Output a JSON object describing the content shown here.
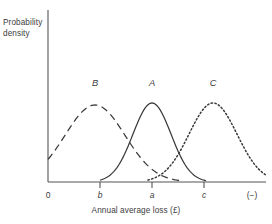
{
  "axes": {
    "ylabel": "Probability\ndensity",
    "xlabel": "Annual average loss (£)",
    "tick_labels": [
      {
        "text": "0",
        "x": 48,
        "italic": false
      },
      {
        "text": "b",
        "x": 100,
        "italic": true
      },
      {
        "text": "a",
        "x": 152,
        "italic": true
      },
      {
        "text": "c",
        "x": 204,
        "italic": true
      },
      {
        "text": "(−)",
        "x": 252,
        "italic": false
      }
    ],
    "axis_color": "#555555"
  },
  "curve_labels": [
    {
      "text": "B",
      "x": 95,
      "y": 78
    },
    {
      "text": "A",
      "x": 152,
      "y": 78
    },
    {
      "text": "C",
      "x": 213,
      "y": 78
    }
  ],
  "chart_data": {
    "type": "line",
    "title": "",
    "xlabel": "Annual average loss (£)",
    "ylabel": "Probability density",
    "xlim": [
      0,
      272
    ],
    "ylim": [
      0,
      1
    ],
    "grid": false,
    "legend": "inline-labels",
    "xtick_labels": [
      "0",
      "b",
      "a",
      "c",
      "(−)"
    ],
    "xtick_positions": [
      48,
      100,
      152,
      204,
      252
    ],
    "ytick_labels": [],
    "series": [
      {
        "name": "B",
        "style": "dashed",
        "color": "#3a3a3a",
        "mean": 95,
        "sigma": 30,
        "peak_y": 105,
        "baseline_y": 182,
        "x_start": 48,
        "x_end": 180,
        "label": "B"
      },
      {
        "name": "A",
        "style": "solid",
        "color": "#3a3a3a",
        "mean": 152,
        "sigma": 19,
        "peak_y": 103,
        "baseline_y": 182,
        "x_start": 100,
        "x_end": 206,
        "label": "A"
      },
      {
        "name": "C",
        "style": "dotted",
        "color": "#3a3a3a",
        "mean": 213,
        "sigma": 24,
        "peak_y": 103,
        "baseline_y": 182,
        "x_start": 148,
        "x_end": 266,
        "label": "C"
      }
    ]
  },
  "geometry": {
    "y_axis_x": 48,
    "y_axis_top": 10,
    "baseline_y": 182,
    "x_axis_end": 266,
    "tick_length": 6
  }
}
